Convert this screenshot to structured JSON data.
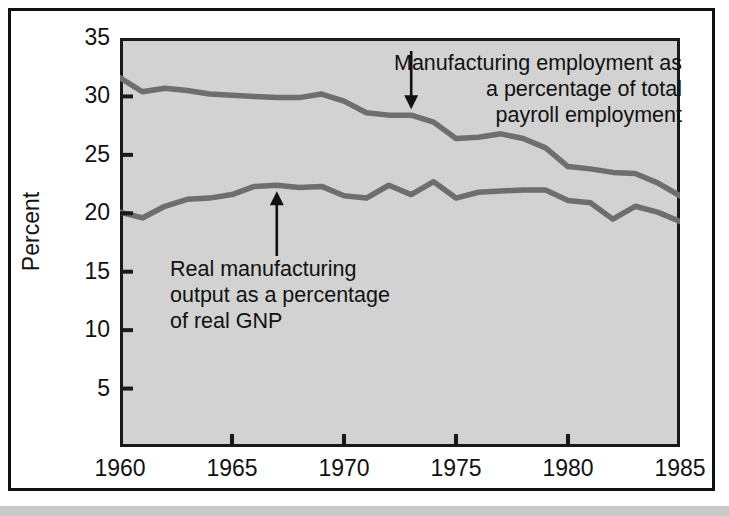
{
  "figure": {
    "background": "#ffffff",
    "plot_background": "#d2d2d2",
    "frame_color": "#1a1a1a",
    "line_color": "#6e6e6e"
  },
  "axes": {
    "ylabel": "Percent",
    "yticks": [
      "35",
      "30",
      "25",
      "20",
      "15",
      "10",
      "5"
    ],
    "xticks": [
      "1960",
      "1965",
      "1970",
      "1975",
      "1980",
      "1985"
    ]
  },
  "annotations": {
    "employment": "Manufacturing employment as\na percentage of total\npayroll employment",
    "output": "Real manufacturing\noutput as a percentage\nof real GNP"
  },
  "chart_data": {
    "type": "line",
    "title": "",
    "xlabel": "",
    "ylabel": "Percent",
    "xlim": [
      1960,
      1985
    ],
    "ylim": [
      0,
      35
    ],
    "yticks": [
      5,
      10,
      15,
      20,
      25,
      30,
      35
    ],
    "xticks": [
      1960,
      1965,
      1970,
      1975,
      1980,
      1985
    ],
    "grid": false,
    "legend": "annotations-with-arrows",
    "x": [
      1960,
      1961,
      1962,
      1963,
      1964,
      1965,
      1966,
      1967,
      1968,
      1969,
      1970,
      1971,
      1972,
      1973,
      1974,
      1975,
      1976,
      1977,
      1978,
      1979,
      1980,
      1981,
      1982,
      1983,
      1984,
      1985
    ],
    "series": [
      {
        "name": "Manufacturing employment as a percentage of total payroll employment",
        "values": [
          31.6,
          30.4,
          30.7,
          30.5,
          30.2,
          30.1,
          30.0,
          29.9,
          29.9,
          30.2,
          29.6,
          28.6,
          28.4,
          28.4,
          27.8,
          26.4,
          26.5,
          26.8,
          26.4,
          25.6,
          24.0,
          23.8,
          23.5,
          23.4,
          22.6,
          21.5
        ]
      },
      {
        "name": "Real manufacturing output as a percentage of real GNP",
        "values": [
          20.1,
          19.6,
          20.6,
          21.2,
          21.3,
          21.6,
          22.3,
          22.4,
          22.2,
          22.3,
          21.5,
          21.3,
          22.4,
          21.6,
          22.7,
          21.3,
          21.8,
          21.9,
          22.0,
          22.0,
          21.1,
          20.9,
          19.5,
          20.6,
          20.1,
          19.3
        ]
      }
    ],
    "arrows": [
      {
        "target_series": 0,
        "target_x": 1973,
        "label": "employment"
      },
      {
        "target_series": 1,
        "target_x": 1967,
        "label": "output"
      }
    ]
  }
}
